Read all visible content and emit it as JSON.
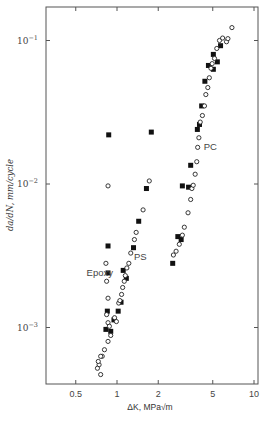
{
  "chart_data": {
    "type": "scatter",
    "title": "",
    "xlabel": "ΔK, MPa√m",
    "ylabel": "da/dN, mm/cycle",
    "xscale": "log",
    "yscale": "log",
    "xlim": [
      0.35,
      11
    ],
    "ylim": [
      0.00028,
      0.18
    ],
    "x_ticks": [
      {
        "value": 0.5,
        "label": "0.5"
      },
      {
        "value": 1,
        "label": "1"
      },
      {
        "value": 2,
        "label": "2"
      },
      {
        "value": 5,
        "label": "5"
      },
      {
        "value": 10,
        "label": "10"
      }
    ],
    "y_ticks": [
      {
        "value": 0.1,
        "base": "10",
        "exp": "−1"
      },
      {
        "value": 0.01,
        "base": "10",
        "exp": "−2"
      },
      {
        "value": 0.001,
        "base": "10",
        "exp": "−3"
      }
    ],
    "grid": false,
    "legend": "none",
    "annotations": [
      {
        "text": "Epoxy",
        "x": 0.6,
        "y": 0.0024
      },
      {
        "text": "PS",
        "x": 1.33,
        "y": 0.0031
      },
      {
        "text": "PC",
        "x": 4.3,
        "y": 0.018
      }
    ],
    "series": [
      {
        "name": "filled squares",
        "marker": "square-filled",
        "points": [
          [
            0.87,
            0.022
          ],
          [
            1.78,
            0.023
          ],
          [
            0.86,
            0.0037
          ],
          [
            0.86,
            0.0024
          ],
          [
            0.85,
            0.0013
          ],
          [
            0.83,
            0.00097
          ],
          [
            0.9,
            0.00094
          ],
          [
            0.95,
            0.00113
          ],
          [
            1.02,
            0.0013
          ],
          [
            1.07,
            0.0015
          ],
          [
            1.11,
            0.0025
          ],
          [
            1.17,
            0.0022
          ],
          [
            1.32,
            0.0036
          ],
          [
            1.44,
            0.0055
          ],
          [
            1.64,
            0.0093
          ],
          [
            2.55,
            0.0028
          ],
          [
            2.78,
            0.0043
          ],
          [
            2.94,
            0.0041
          ],
          [
            3.0,
            0.0097
          ],
          [
            3.33,
            0.0095
          ],
          [
            3.45,
            0.0135
          ],
          [
            3.86,
            0.024
          ],
          [
            4.0,
            0.026
          ],
          [
            4.15,
            0.035
          ],
          [
            4.38,
            0.052
          ],
          [
            4.65,
            0.067
          ],
          [
            5.05,
            0.08
          ],
          [
            5.05,
            0.063
          ],
          [
            5.4,
            0.071
          ],
          [
            5.7,
            0.092
          ]
        ]
      },
      {
        "name": "open circles",
        "marker": "circle-open",
        "points": [
          [
            0.86,
            0.0097
          ],
          [
            0.83,
            0.0028
          ],
          [
            0.84,
            0.0021
          ],
          [
            0.86,
            0.0016
          ],
          [
            0.84,
            0.00123
          ],
          [
            0.86,
            0.00108
          ],
          [
            0.88,
            0.00102
          ],
          [
            0.9,
            0.00088
          ],
          [
            0.86,
            0.0008
          ],
          [
            0.81,
            0.0007
          ],
          [
            0.78,
            0.00063
          ],
          [
            0.76,
            0.00063
          ],
          [
            0.74,
            0.00055
          ],
          [
            0.72,
            0.00052
          ],
          [
            0.73,
            0.00058
          ],
          [
            0.76,
            0.00047
          ],
          [
            0.96,
            0.00117
          ],
          [
            0.99,
            0.0011
          ],
          [
            1.03,
            0.00148
          ],
          [
            1.05,
            0.00154
          ],
          [
            1.08,
            0.0017
          ],
          [
            1.1,
            0.0019
          ],
          [
            1.13,
            0.0021
          ],
          [
            1.15,
            0.0023
          ],
          [
            1.18,
            0.0026
          ],
          [
            1.22,
            0.0028
          ],
          [
            1.26,
            0.0033
          ],
          [
            1.34,
            0.0041
          ],
          [
            1.38,
            0.0046
          ],
          [
            1.55,
            0.0066
          ],
          [
            1.72,
            0.0105
          ],
          [
            2.58,
            0.0032
          ],
          [
            2.7,
            0.0034
          ],
          [
            2.85,
            0.0038
          ],
          [
            3.0,
            0.0044
          ],
          [
            3.1,
            0.005
          ],
          [
            3.3,
            0.0063
          ],
          [
            3.45,
            0.0078
          ],
          [
            3.52,
            0.0093
          ],
          [
            3.6,
            0.0098
          ],
          [
            3.72,
            0.0117
          ],
          [
            3.82,
            0.0143
          ],
          [
            3.88,
            0.018
          ],
          [
            3.96,
            0.021
          ],
          [
            4.05,
            0.027
          ],
          [
            4.2,
            0.03
          ],
          [
            4.35,
            0.035
          ],
          [
            4.45,
            0.042
          ],
          [
            4.6,
            0.047
          ],
          [
            4.72,
            0.055
          ],
          [
            4.85,
            0.064
          ],
          [
            4.95,
            0.069
          ],
          [
            5.15,
            0.075
          ],
          [
            5.35,
            0.088
          ],
          [
            5.6,
            0.1
          ],
          [
            5.9,
            0.104
          ],
          [
            6.3,
            0.098
          ],
          [
            6.45,
            0.103
          ],
          [
            6.9,
            0.123
          ]
        ]
      }
    ]
  }
}
